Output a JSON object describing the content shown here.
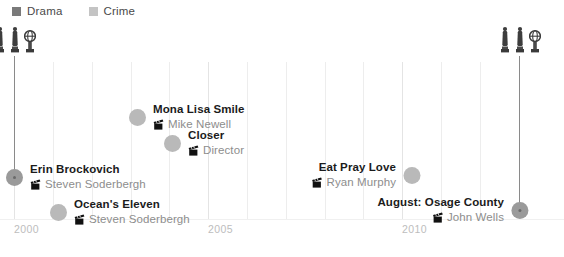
{
  "legend": {
    "items": [
      {
        "label": "Drama",
        "color": "#7a7a7a",
        "icon": "legend-swatch-icon"
      },
      {
        "label": "Crime",
        "color": "#c4c4c4",
        "icon": "legend-swatch-icon"
      }
    ]
  },
  "axis": {
    "ticks": [
      {
        "label": "2000",
        "x": 14
      },
      {
        "label": "2005",
        "x": 208
      },
      {
        "label": "2010",
        "x": 402
      }
    ],
    "gridlines_x": [
      14,
      53,
      92,
      131,
      169,
      208,
      247,
      286,
      325,
      363,
      402,
      441,
      480,
      519
    ],
    "major_gridlines_x": [
      14,
      208,
      402
    ]
  },
  "award_groups": [
    {
      "name": "awards-2000",
      "x": 14,
      "y": 26,
      "stem_top": 56,
      "stem_height": 114,
      "trophies": [
        {
          "type": "oscar",
          "caption": "Academy Award"
        },
        {
          "type": "oscar",
          "caption": "Academy Award"
        },
        {
          "type": "globe",
          "caption": "Golden Globe"
        }
      ]
    },
    {
      "name": "awards-2013",
      "x": 519,
      "y": 26,
      "stem_top": 56,
      "stem_height": 149,
      "trophies": [
        {
          "type": "oscar",
          "caption": "Academy Award"
        },
        {
          "type": "oscar",
          "caption": "Academy Award"
        },
        {
          "type": "globe",
          "caption": "Golden Globe"
        }
      ]
    }
  ],
  "films": [
    {
      "name": "film-erin-brockovich",
      "title": "Erin Brockovich",
      "director": "Steven Soderbergh",
      "dot_x": 14,
      "dot_y": 172,
      "dot_style": "dark",
      "label_side": "left",
      "icon": "clapperboard-icon"
    },
    {
      "name": "film-oceans-eleven",
      "title": "Ocean's Eleven",
      "director": "Steven Soderbergh",
      "dot_x": 58,
      "dot_y": 207,
      "dot_style": "light",
      "label_side": "left",
      "icon": "clapperboard-icon"
    },
    {
      "name": "film-mona-lisa-smile",
      "title": "Mona Lisa Smile",
      "director": "Mike Newell",
      "dot_x": 137,
      "dot_y": 112,
      "dot_style": "light",
      "label_side": "left",
      "icon": "clapperboard-icon"
    },
    {
      "name": "film-closer",
      "title": "Closer",
      "director": "Director",
      "dot_x": 172,
      "dot_y": 138,
      "dot_style": "light",
      "label_side": "left",
      "icon": "clapperboard-icon"
    },
    {
      "name": "film-eat-pray-love",
      "title": "Eat Pray Love",
      "director": "Ryan Murphy",
      "dot_x": 411,
      "dot_y": 170,
      "dot_style": "light",
      "label_side": "right",
      "icon": "clapperboard-icon"
    },
    {
      "name": "film-august-osage-county",
      "title": "August: Osage County",
      "director": "John Wells",
      "dot_x": 519,
      "dot_y": 205,
      "dot_style": "dark",
      "label_side": "right",
      "icon": "clapperboard-icon"
    }
  ],
  "chart_data": {
    "type": "scatter",
    "title": "",
    "xlabel": "",
    "ylabel": "",
    "xlim": [
      2000,
      2013
    ],
    "categories": [
      "Drama",
      "Crime"
    ],
    "points": [
      {
        "label": "Erin Brockovich",
        "director": "Steven Soderbergh",
        "year": 2000
      },
      {
        "label": "Ocean's Eleven",
        "director": "Steven Soderbergh",
        "year": 2001
      },
      {
        "label": "Mona Lisa Smile",
        "director": "Mike Newell",
        "year": 2003
      },
      {
        "label": "Closer",
        "director": "Director",
        "year": 2004
      },
      {
        "label": "Eat Pray Love",
        "director": "Ryan Murphy",
        "year": 2010
      },
      {
        "label": "August: Osage County",
        "director": "John Wells",
        "year": 2013
      }
    ],
    "tick_labels": [
      "2000",
      "2005",
      "2010"
    ],
    "legend_entries": [
      "Drama",
      "Crime"
    ],
    "grid": true,
    "legend_position": "top-left"
  }
}
